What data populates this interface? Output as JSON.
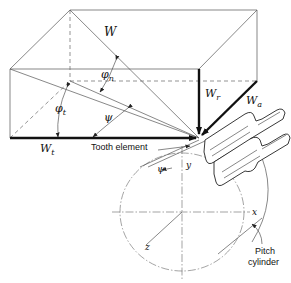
{
  "figure": {
    "type": "helical gear force components diagram",
    "labels": {
      "total_force": "W",
      "normal_pressure_angle": "φ",
      "normal_pressure_angle_sub": "n",
      "transverse_pressure_angle": "φ",
      "transverse_pressure_angle_sub": "t",
      "helix_angle_upper": "ψ",
      "helix_angle_lower": "ψ",
      "radial_force": "W",
      "radial_force_sub": "r",
      "axial_force": "W",
      "axial_force_sub": "a",
      "tangential_force": "W",
      "tangential_force_sub": "t",
      "tooth_element": "Tooth element",
      "axis_x": "x",
      "axis_y": "y",
      "axis_z": "z",
      "pitch_cylinder_line1": "Pitch",
      "pitch_cylinder_line2": "cylinder"
    },
    "colors": {
      "line": "#555555",
      "force": "#111111",
      "background": "#ffffff"
    }
  }
}
